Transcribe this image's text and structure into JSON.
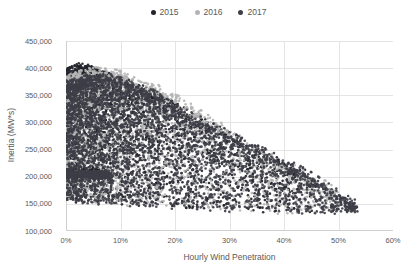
{
  "chart_data": {
    "type": "scatter",
    "title": "",
    "xlabel": "Hourly Wind Penetration",
    "ylabel": "Inertia (MW*s)",
    "xlim": [
      0,
      60
    ],
    "ylim": [
      100000,
      450000
    ],
    "grid": true,
    "legend_position": "top",
    "x_tick_labels": [
      "0%",
      "10%",
      "20%",
      "30%",
      "40%",
      "50%",
      "60%"
    ],
    "y_tick_labels": [
      "450,000",
      "400,000",
      "350,000",
      "300,000",
      "250,000",
      "200,000",
      "150,000",
      "100,000"
    ],
    "grid_color": "#e4e4e4",
    "axis_color": "#cfcfcf",
    "text_color": "#595959",
    "series": [
      {
        "name": "2015",
        "color": "#23232b",
        "n_points": 2600,
        "x_range": [
          0.1,
          46
        ],
        "top_env": {
          "x": [
            0,
            1.5,
            3,
            5,
            8,
            12,
            16,
            20,
            25,
            30,
            35,
            40,
            43,
            46
          ],
          "y": [
            386000,
            396000,
            399000,
            390000,
            380000,
            366000,
            348000,
            326000,
            298000,
            272000,
            245000,
            222000,
            205000,
            190000
          ]
        },
        "bottom_env": {
          "x": [
            0,
            6,
            12,
            20,
            30,
            40,
            46
          ],
          "y": [
            157000,
            151000,
            147000,
            143000,
            139000,
            134000,
            138000
          ]
        },
        "clusters": [
          {
            "x": [
              0.1,
              7
            ],
            "y": [
              199000,
              214000
            ],
            "n": 550
          }
        ]
      },
      {
        "name": "2016",
        "color": "#b4b4b4",
        "n_points": 2300,
        "x_range": [
          0.1,
          50
        ],
        "top_env": {
          "x": [
            0,
            3,
            6,
            10,
            14,
            18,
            22,
            26,
            30,
            34,
            38,
            42,
            46,
            50
          ],
          "y": [
            375000,
            385000,
            391000,
            385000,
            372000,
            352000,
            330000,
            305000,
            280000,
            255000,
            232000,
            210000,
            190000,
            170000
          ]
        },
        "bottom_env": {
          "x": [
            0,
            10,
            20,
            30,
            40,
            46,
            50
          ],
          "y": [
            160000,
            149000,
            143000,
            139000,
            134000,
            132000,
            140000
          ]
        },
        "clusters": []
      },
      {
        "name": "2017",
        "color": "#3e3e48",
        "n_points": 3300,
        "x_range": [
          0.1,
          53.5
        ],
        "top_env": {
          "x": [
            0,
            4,
            8,
            12,
            16,
            20,
            24,
            28,
            32,
            36,
            40,
            44,
            48,
            51,
            53.5
          ],
          "y": [
            365000,
            376000,
            378000,
            366000,
            349000,
            325000,
            303000,
            283000,
            262000,
            243000,
            225000,
            203000,
            178000,
            160000,
            148000
          ]
        },
        "bottom_env": {
          "x": [
            0,
            8,
            16,
            24,
            32,
            40,
            46,
            50,
            53.5
          ],
          "y": [
            155000,
            147000,
            142000,
            139000,
            135000,
            132000,
            130000,
            131000,
            136000
          ]
        },
        "clusters": [
          {
            "x": [
              0.1,
              8
            ],
            "y": [
              197000,
              210000
            ],
            "n": 320
          },
          {
            "x": [
              47,
              53.5
            ],
            "y": [
              132000,
              152000
            ],
            "n": 30
          }
        ]
      }
    ]
  }
}
